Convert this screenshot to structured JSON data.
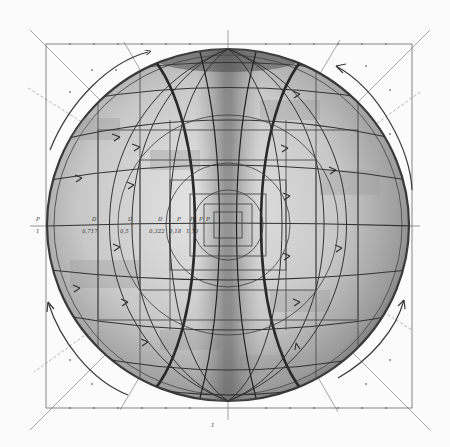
{
  "drawing": {
    "type": "pencil geometric construction drawing",
    "subject": "sphere with hourglass pinch at center, latitude/longitude grid, flow arrows",
    "colors": {
      "paper": "#fbfbfb",
      "pencil_dark": "#2e2e2e",
      "pencil_mid": "#5a5a5a",
      "shade_light": "#d4d4d4",
      "shade_mid": "#a9a9a9",
      "shade_dark": "#7a7a7a"
    }
  },
  "axis_labels": {
    "top_row": [
      "P",
      "D",
      "D",
      "D",
      "P",
      "P",
      "P",
      "P"
    ],
    "bottom_row": [
      "1",
      "0,717",
      "0,5",
      "0,322",
      "0,18",
      "1,70"
    ]
  },
  "bottom_mark": "1",
  "icons": {
    "arrow": "arrow-head-icon"
  }
}
